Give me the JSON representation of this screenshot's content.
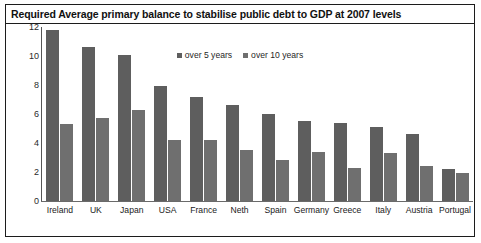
{
  "title": "Required Average primary balance to stabilise public debt to GDP at 2007 levels",
  "legend": {
    "series1": "over 5 years",
    "series2": "over 10 years"
  },
  "chart_data": {
    "type": "bar",
    "title": "Required Average primary balance to stabilise public debt to GDP at 2007 levels",
    "xlabel": "",
    "ylabel": "",
    "ylim": [
      0,
      12
    ],
    "yticks": [
      0,
      2,
      4,
      6,
      8,
      10,
      12
    ],
    "grid": false,
    "legend_position": "top-center",
    "categories": [
      "Ireland",
      "UK",
      "Japan",
      "USA",
      "France",
      "Neth",
      "Spain",
      "Germany",
      "Greece",
      "Italy",
      "Austria",
      "Portugal"
    ],
    "series": [
      {
        "name": "over 5 years",
        "values": [
          11.8,
          10.6,
          10.1,
          7.9,
          7.2,
          6.6,
          6.0,
          5.5,
          5.4,
          5.1,
          4.6,
          2.2
        ]
      },
      {
        "name": "over 10 years",
        "values": [
          5.3,
          5.7,
          6.3,
          4.2,
          4.2,
          3.5,
          2.8,
          3.4,
          2.3,
          3.3,
          2.4,
          1.9
        ]
      }
    ]
  },
  "colors": {
    "series1": "#5e5e5e",
    "series2": "#6f6f6f",
    "frame": "#1c1c1c",
    "background": "#ffffff"
  }
}
